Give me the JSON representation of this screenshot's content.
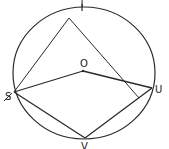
{
  "diagram": {
    "type": "circle-geometry",
    "stroke_color": "#2a2a2a",
    "background": "#ffffff",
    "circle": {
      "center_label": "O"
    },
    "points": {
      "T": {
        "label": "T"
      },
      "O": {
        "label": "O"
      },
      "S": {
        "label": "S"
      },
      "U": {
        "label": "U"
      },
      "V": {
        "label": "V"
      }
    },
    "segments": [
      "S-A",
      "A-P",
      "S-O",
      "O-U",
      "S-V",
      "V-U"
    ]
  }
}
